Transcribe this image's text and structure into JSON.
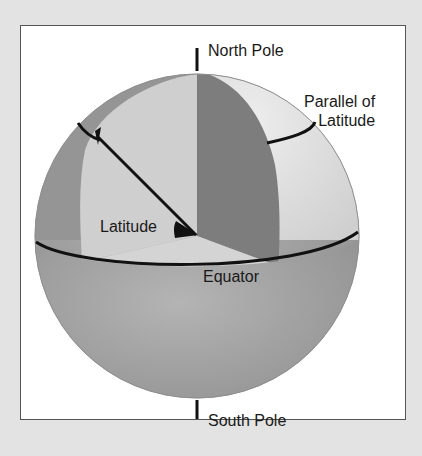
{
  "diagram": {
    "labels": {
      "north_pole": "North Pole",
      "south_pole": "South Pole",
      "parallel_line1": "Parallel of",
      "parallel_line2": "Latitude",
      "latitude": "Latitude",
      "equator": "Equator"
    },
    "colors": {
      "background": "#e3e3e3",
      "frame": "#ffffff",
      "frame_border": "#555555",
      "sphere_dark": "#8c8c8c",
      "sphere_mid": "#a8a8a8",
      "sphere_light": "#d2d2d2",
      "sphere_lighter": "#dedede",
      "meridian_dark": "#7a7a7a",
      "lines": "#111111"
    }
  }
}
